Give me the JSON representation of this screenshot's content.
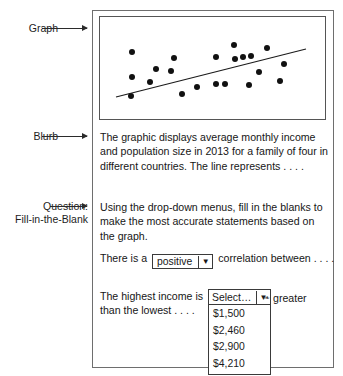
{
  "annotations": {
    "graph_label": "Graph",
    "blurb_label": "Blurb",
    "question_label_line1": "Question:",
    "question_label_line2": "Fill-in-the-Blank"
  },
  "blurb": {
    "text": "The graphic displays average monthly income and population size in 2013 for a family of four in different countries. The line represents . . . ."
  },
  "question": {
    "intro": "Using the drop-down menus, fill in the blanks to make the most accurate statements based on the graph.",
    "statement1_before": "There is a",
    "statement1_after": "correlation between . . . .",
    "statement2_text": "The highest income is",
    "statement2_after": "greater",
    "statement2_line2": "than the lowest . . . ."
  },
  "dropdown_correlation": {
    "value": "positive",
    "caret": "▼"
  },
  "dropdown_amount": {
    "value": "Select…",
    "caret": "▼",
    "options": [
      "$1,500",
      "$2,460",
      "$2,900",
      "$4,210"
    ]
  },
  "chart_data": {
    "type": "scatter",
    "title": "",
    "xlabel": "Population size",
    "ylabel": "Average monthly income",
    "grid": false,
    "legend": "none",
    "axis_visible": false,
    "xlim": [
      0,
      227
    ],
    "ylim": [
      0,
      104
    ],
    "points": [
      [
        32,
        35
      ],
      [
        32,
        60
      ],
      [
        31,
        79
      ],
      [
        50,
        65
      ],
      [
        56,
        52
      ],
      [
        71,
        54
      ],
      [
        74,
        41
      ],
      [
        82,
        77
      ],
      [
        97,
        70
      ],
      [
        116,
        40
      ],
      [
        116,
        67
      ],
      [
        134,
        28
      ],
      [
        135,
        42
      ],
      [
        125,
        67
      ],
      [
        143,
        40
      ],
      [
        151,
        39
      ],
      [
        159,
        55
      ],
      [
        149,
        68
      ],
      [
        167,
        31
      ],
      [
        180,
        64
      ],
      [
        184,
        47
      ]
    ],
    "trendline": {
      "x1": 16,
      "y1": 80,
      "x2": 206,
      "y2": 32,
      "label": "line of best fit"
    },
    "annotation": "positive correlation"
  }
}
